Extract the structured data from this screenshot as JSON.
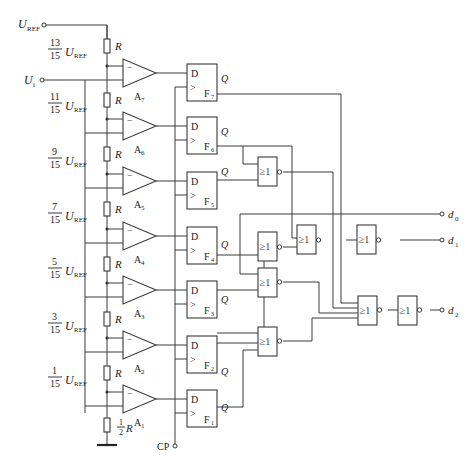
{
  "inputs": {
    "uref_label": "U",
    "uref_sub": "REF",
    "ui_label": "U",
    "ui_sub": "i",
    "cp_label": "CP"
  },
  "ladder": {
    "resistor_label": "R",
    "half_resistor_num": "1",
    "half_resistor_den": "2",
    "half_resistor_label": "R",
    "taps": [
      {
        "num": "13",
        "den": "15",
        "u": "U",
        "sub": "REF"
      },
      {
        "num": "11",
        "den": "15",
        "u": "U",
        "sub": "REF"
      },
      {
        "num": "9",
        "den": "15",
        "u": "U",
        "sub": "REF"
      },
      {
        "num": "7",
        "den": "15",
        "u": "U",
        "sub": "REF"
      },
      {
        "num": "5",
        "den": "15",
        "u": "U",
        "sub": "REF"
      },
      {
        "num": "3",
        "den": "15",
        "u": "U",
        "sub": "REF"
      },
      {
        "num": "1",
        "den": "15",
        "u": "U",
        "sub": "REF"
      }
    ]
  },
  "comparators": [
    {
      "name": "A",
      "sub": "7",
      "minus": "−"
    },
    {
      "name": "A",
      "sub": "6",
      "minus": "−"
    },
    {
      "name": "A",
      "sub": "5",
      "minus": "−"
    },
    {
      "name": "A",
      "sub": "4",
      "minus": "−"
    },
    {
      "name": "A",
      "sub": "3",
      "minus": "−"
    },
    {
      "name": "A",
      "sub": "2",
      "minus": "−"
    },
    {
      "name": "A",
      "sub": "1",
      "minus": "−"
    }
  ],
  "flipflops": [
    {
      "d": "D",
      "clk": ">",
      "name": "F",
      "sub": "7",
      "q": "Q"
    },
    {
      "d": "D",
      "clk": ">",
      "name": "F",
      "sub": "6",
      "q": "Q"
    },
    {
      "d": "D",
      "clk": ">",
      "name": "F",
      "sub": "5",
      "q": "Q"
    },
    {
      "d": "D",
      "clk": ">",
      "name": "F",
      "sub": "4",
      "q": "Q"
    },
    {
      "d": "D",
      "clk": ">",
      "name": "F",
      "sub": "3",
      "q": "Q"
    },
    {
      "d": "D",
      "clk": ">",
      "name": "F",
      "sub": "2",
      "q": "Q"
    },
    {
      "d": "D",
      "clk": ">",
      "name": "F",
      "sub": "1",
      "q": "Q"
    }
  ],
  "gates": {
    "nor_label": "≥1",
    "count": 8
  },
  "outputs": [
    {
      "name": "d",
      "sub": "0"
    },
    {
      "name": "d",
      "sub": "1"
    },
    {
      "name": "d",
      "sub": "2"
    }
  ]
}
